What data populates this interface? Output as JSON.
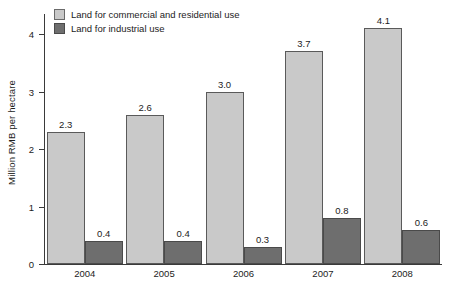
{
  "chart_data": {
    "type": "bar",
    "title": "",
    "subtitle": "",
    "xlabel": "",
    "ylabel": "Million RMB per hectare",
    "categories": [
      "2004",
      "2005",
      "2006",
      "2007",
      "2008"
    ],
    "ylim": [
      0,
      4.35
    ],
    "yticks": [
      "0",
      "1",
      "2",
      "3",
      "4"
    ],
    "ytick_values": [
      0,
      1,
      2,
      3,
      4
    ],
    "grid": false,
    "legend_position": "top-left",
    "series": [
      {
        "name": "Land for commercial and residential use",
        "color": "#c9c9c9",
        "values": [
          2.3,
          2.6,
          3.0,
          3.7,
          4.1
        ],
        "labels": [
          "2.3",
          "2.6",
          "3.0",
          "3.7",
          "4.1"
        ]
      },
      {
        "name": "Land for industrial use",
        "color": "#6e6e6e",
        "values": [
          0.4,
          0.4,
          0.3,
          0.8,
          0.6
        ],
        "labels": [
          "0.4",
          "0.4",
          "0.3",
          "0.8",
          "0.6"
        ]
      }
    ]
  },
  "colors": {
    "commercial": "#c9c9c9",
    "industrial": "#6e6e6e",
    "axis": "#3a3a3a",
    "text": "#1c1c1c",
    "background": "#ffffff"
  }
}
